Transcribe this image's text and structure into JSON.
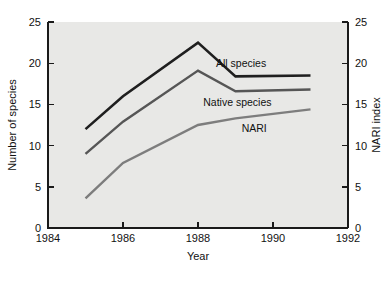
{
  "chart_data": {
    "type": "line",
    "title": "",
    "xlabel": "Year",
    "ylabel": "Number of species",
    "y2label": "NARI index",
    "xlim": [
      1984,
      1992
    ],
    "ylim": [
      0,
      25
    ],
    "y2lim": [
      0,
      25
    ],
    "grid": false,
    "legend_position": "inline-right",
    "xticks": [
      1984,
      1986,
      1988,
      1990,
      1992
    ],
    "xtick_labels": [
      "1984",
      "1986",
      "1988",
      "1990",
      "1992"
    ],
    "yticks": [
      0,
      5,
      10,
      15,
      20,
      25
    ],
    "ytick_labels": [
      "0",
      "5",
      "10",
      "15",
      "20",
      "25"
    ],
    "y2ticks": [
      0,
      5,
      10,
      15,
      20,
      25
    ],
    "y2tick_labels": [
      "0",
      "5",
      "10",
      "15",
      "20",
      "25"
    ],
    "x": [
      1985,
      1986,
      1988,
      1989,
      1991
    ],
    "series": [
      {
        "name": "All species",
        "axis": "left",
        "color": "#1f1f1f",
        "width": 2.6,
        "values": [
          12.0,
          16.0,
          22.5,
          18.4,
          18.5
        ]
      },
      {
        "name": "Native species",
        "axis": "left",
        "color": "#565656",
        "width": 2.4,
        "values": [
          9.0,
          12.9,
          19.1,
          16.6,
          16.8
        ]
      },
      {
        "name": "NARI",
        "axis": "right",
        "color": "#7d7d7d",
        "width": 2.4,
        "values": [
          3.6,
          7.9,
          12.5,
          13.3,
          14.4
        ]
      }
    ],
    "annotations": [
      {
        "text": "All species",
        "x": 1989.15,
        "y": 20.0
      },
      {
        "text": "Native species",
        "x": 1989.05,
        "y": 15.3
      },
      {
        "text": "NARI",
        "x": 1989.5,
        "y": 12.1
      }
    ],
    "background_color": "#e8e8e6",
    "figure_color": "#ffffff",
    "axis_color": "#1a1a1a"
  }
}
